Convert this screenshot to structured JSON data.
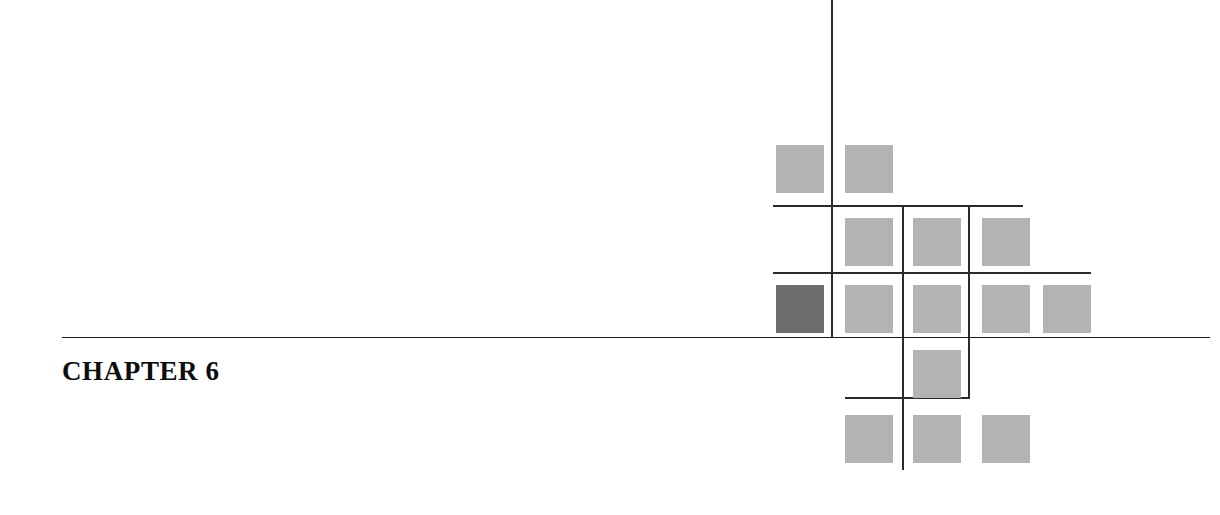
{
  "page": {
    "width": 1220,
    "height": 515,
    "background": "#ffffff"
  },
  "heading": {
    "label": "CHAPTER 6",
    "chapter_word": "CHAPTER",
    "chapter_number": "6",
    "color": "#0d0d0d",
    "x": 62,
    "y": 356
  },
  "main_rule": {
    "name": "chapter-divider-rule",
    "color": "#1a1a1a",
    "x": 62,
    "y": 337,
    "width": 1148,
    "thickness": 1
  },
  "decor": {
    "square_size": 48,
    "colors": {
      "light": "#b3b3b3",
      "dark": "#6e6e6e"
    },
    "line_color": "#2b2b2b",
    "squares": [
      {
        "id": "sq-r1-c1",
        "row": 1,
        "col": 1,
        "x": 776,
        "y": 145,
        "tone": "light"
      },
      {
        "id": "sq-r1-c2",
        "row": 1,
        "col": 2,
        "x": 845,
        "y": 145,
        "tone": "light"
      },
      {
        "id": "sq-r2-c2",
        "row": 2,
        "col": 2,
        "x": 845,
        "y": 218,
        "tone": "light"
      },
      {
        "id": "sq-r2-c3",
        "row": 2,
        "col": 3,
        "x": 913,
        "y": 218,
        "tone": "light"
      },
      {
        "id": "sq-r2-c4",
        "row": 2,
        "col": 4,
        "x": 982,
        "y": 218,
        "tone": "light"
      },
      {
        "id": "sq-r3-c1",
        "row": 3,
        "col": 1,
        "x": 776,
        "y": 285,
        "tone": "dark"
      },
      {
        "id": "sq-r3-c2",
        "row": 3,
        "col": 2,
        "x": 845,
        "y": 285,
        "tone": "light"
      },
      {
        "id": "sq-r3-c3",
        "row": 3,
        "col": 3,
        "x": 913,
        "y": 285,
        "tone": "light"
      },
      {
        "id": "sq-r3-c4",
        "row": 3,
        "col": 4,
        "x": 982,
        "y": 285,
        "tone": "light"
      },
      {
        "id": "sq-r3-c5",
        "row": 3,
        "col": 5,
        "x": 1043,
        "y": 285,
        "tone": "light"
      },
      {
        "id": "sq-r4-c3",
        "row": 4,
        "col": 3,
        "x": 913,
        "y": 350,
        "tone": "light"
      },
      {
        "id": "sq-r5-c2",
        "row": 5,
        "col": 2,
        "x": 845,
        "y": 415,
        "tone": "light"
      },
      {
        "id": "sq-r5-c3",
        "row": 5,
        "col": 3,
        "x": 913,
        "y": 415,
        "tone": "light"
      },
      {
        "id": "sq-r5-c4",
        "row": 5,
        "col": 4,
        "x": 982,
        "y": 415,
        "tone": "light"
      }
    ],
    "vlines": [
      {
        "id": "vline-1",
        "x": 831,
        "y": 0,
        "height": 338
      },
      {
        "id": "vline-2",
        "x": 902,
        "y": 205,
        "height": 265
      },
      {
        "id": "vline-3",
        "x": 968,
        "y": 205,
        "height": 194
      }
    ],
    "hlines": [
      {
        "id": "hline-1",
        "x": 773,
        "y": 205,
        "width": 250
      },
      {
        "id": "hline-2",
        "x": 773,
        "y": 272,
        "width": 318
      },
      {
        "id": "hline-3",
        "x": 845,
        "y": 397,
        "width": 125
      }
    ]
  }
}
